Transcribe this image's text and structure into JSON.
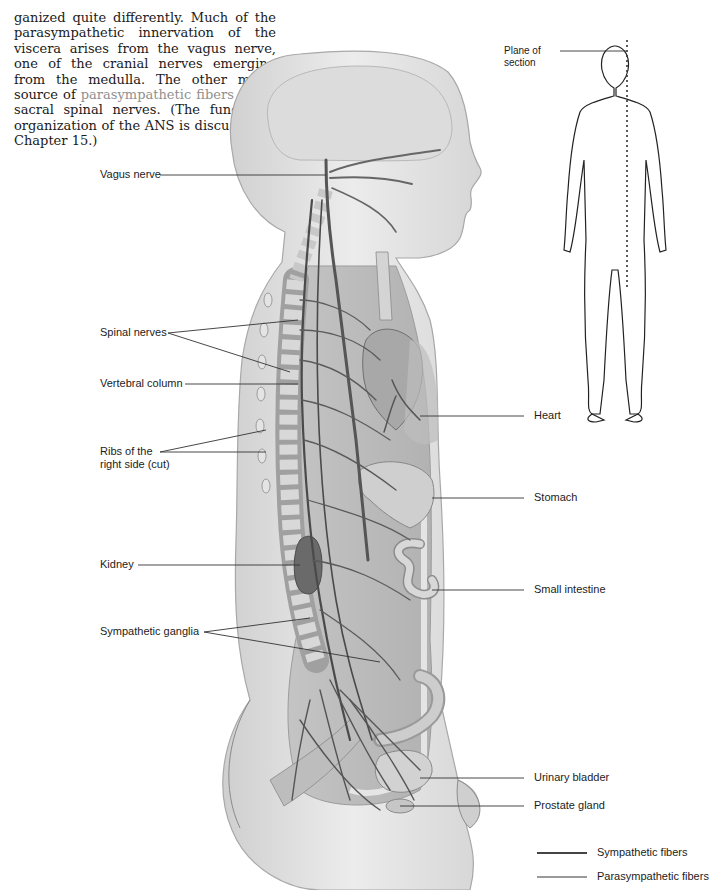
{
  "text": {
    "paragraph_parts": [
      "ganized quite differently. Much of the parasympathetic innervation of the viscera arises from the vagus nerve, one of the cranial nerves emerging from the medulla. The other major source of ",
      "parasympathetic fibers",
      " is the sacral spinal nerves. (The functional organization of the ANS is discussed in Chapter 15.)"
    ]
  },
  "figure": {
    "inset_label": "Plane of section",
    "inset_label_line1": "Plane of",
    "inset_label_line2": "section",
    "left_labels": {
      "vagus": "Vagus nerve",
      "spinal": "Spinal nerves",
      "vertebral": "Vertebral column",
      "ribs_line1": "Ribs of the",
      "ribs_line2": "right side (cut)",
      "kidney": "Kidney",
      "ganglia": "Sympathetic ganglia"
    },
    "right_labels": {
      "heart": "Heart",
      "stomach": "Stomach",
      "small_intestine": "Small intestine",
      "bladder": "Urinary bladder",
      "prostate": "Prostate gland"
    },
    "legend": [
      {
        "label": "Sympathetic fibers",
        "color": "#444444"
      },
      {
        "label": "Parasympathetic fibers",
        "color": "#9a9a9a"
      }
    ]
  },
  "colors": {
    "body_fill": "#e6e6e6",
    "body_outline": "#9a9a9a",
    "nerve_dark": "#4a4a4a",
    "nerve_light": "#8c8c8c",
    "text": "#1a1a1a",
    "highlight_text": "#8f8f8f"
  }
}
